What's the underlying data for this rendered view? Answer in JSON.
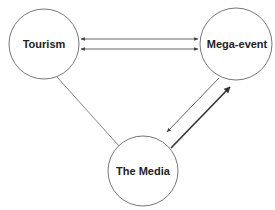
{
  "diagram": {
    "type": "relationship-triangle",
    "nodes": [
      {
        "id": "tourism",
        "label": "Tourism",
        "cx": 44,
        "cy": 44,
        "r": 35
      },
      {
        "id": "mega-event",
        "label": "Mega-event",
        "cx": 236,
        "cy": 44,
        "r": 36
      },
      {
        "id": "media",
        "label": "The Media",
        "cx": 143,
        "cy": 171,
        "r": 35
      }
    ],
    "edges": [
      {
        "from": "tourism",
        "to": "mega-event",
        "style": "thin",
        "arrows": "both",
        "note": "upper line"
      },
      {
        "from": "tourism",
        "to": "mega-event",
        "style": "thin",
        "arrows": "both",
        "note": "lower line"
      },
      {
        "from": "tourism",
        "to": "media",
        "style": "thin",
        "arrows": "none"
      },
      {
        "from": "mega-event",
        "to": "media",
        "style": "thin",
        "arrows": "end"
      },
      {
        "from": "media",
        "to": "mega-event",
        "style": "thick",
        "arrows": "end"
      }
    ],
    "colors": {
      "stroke": "#666666",
      "thick_stroke": "#333333",
      "text": "#222222",
      "background": "#ffffff"
    }
  }
}
